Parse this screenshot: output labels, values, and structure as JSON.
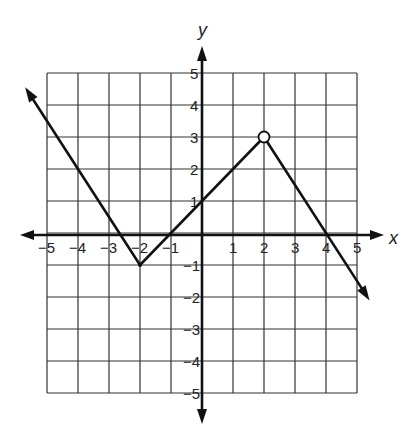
{
  "chart_data": {
    "type": "line",
    "title": "",
    "xlabel": "x",
    "ylabel": "y",
    "xlim": [
      -5,
      5
    ],
    "ylim": [
      -5,
      5
    ],
    "grid": true,
    "x_ticks": [
      "−5",
      "−4",
      "−3",
      "−2",
      "−1",
      "1",
      "2",
      "3",
      "4",
      "5"
    ],
    "y_ticks": [
      "5",
      "4",
      "3",
      "2",
      "1",
      "−1",
      "−2",
      "−3",
      "−4",
      "−5"
    ],
    "series": [
      {
        "name": "piecewise function",
        "points": [
          {
            "x": -5.6,
            "y": 4.4,
            "marker": "arrow"
          },
          {
            "x": -2,
            "y": -1,
            "marker": "vertex"
          },
          {
            "x": 2,
            "y": 3,
            "marker": "open-circle"
          },
          {
            "x": 5.3,
            "y": -1.95,
            "marker": "arrow"
          }
        ],
        "segments": [
          {
            "from": [
              -5.6,
              4.4
            ],
            "to": [
              -2,
              -1
            ],
            "slope": -1.5
          },
          {
            "from": [
              -2,
              -1
            ],
            "to": [
              2,
              3
            ],
            "slope": 1
          },
          {
            "from": [
              2,
              3
            ],
            "to": [
              5.3,
              -1.95
            ],
            "slope": -1.5
          }
        ]
      }
    ],
    "annotations": [
      "open circle at (2, 3)"
    ]
  },
  "labels": {
    "x_axis": "x",
    "y_axis": "y"
  }
}
